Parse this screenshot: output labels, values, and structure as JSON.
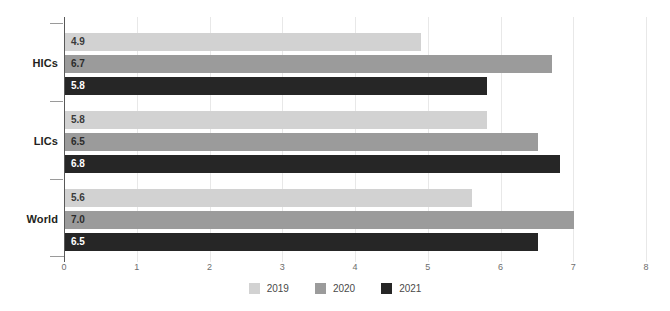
{
  "chart_data": {
    "type": "bar",
    "orientation": "horizontal",
    "title": "",
    "subtitle": "",
    "xlabel": "",
    "ylabel": "",
    "xlim": [
      0,
      8
    ],
    "xticks": [
      "0",
      "1",
      "2",
      "3",
      "4",
      "5",
      "6",
      "7",
      "8"
    ],
    "categories": [
      "HICs",
      "LICs",
      "World"
    ],
    "grid": true,
    "legend_position": "bottom-center",
    "series": [
      {
        "name": "2019",
        "color": "#d2d2d2",
        "values": [
          4.9,
          5.8,
          5.6
        ],
        "labels": [
          "4.9",
          "5.8",
          "5.6"
        ]
      },
      {
        "name": "2020",
        "color": "#9b9b9b",
        "values": [
          6.7,
          6.5,
          7.0
        ],
        "labels": [
          "6.7",
          "6.5",
          "7.0"
        ]
      },
      {
        "name": "2021",
        "color": "#262626",
        "values": [
          5.8,
          6.8,
          6.5
        ],
        "labels": [
          "5.8",
          "6.8",
          "6.5"
        ]
      }
    ]
  }
}
